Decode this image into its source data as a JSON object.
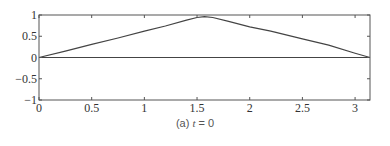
{
  "chart_data": {
    "type": "line",
    "title": "",
    "caption": "(a) t = 0",
    "caption_prefix": "(a)",
    "caption_var": "t",
    "caption_eq": "= 0",
    "xlabel": "",
    "ylabel": "",
    "xlim": [
      0,
      3.1416
    ],
    "ylim": [
      -1,
      1
    ],
    "grid": false,
    "x_ticks": [
      0,
      0.5,
      1,
      1.5,
      2,
      2.5,
      3
    ],
    "x_tick_labels": [
      "0",
      "0.5",
      "1",
      "1.5",
      "2",
      "2.5",
      "3"
    ],
    "y_ticks": [
      -1,
      -0.5,
      0,
      0.5,
      1
    ],
    "y_tick_labels": [
      "−1",
      "−0.5",
      "0",
      "0.5",
      "1"
    ],
    "series": [
      {
        "name": "u(x, t=0)",
        "x": [
          0,
          0.25,
          0.5,
          0.75,
          1.0,
          1.2,
          1.4,
          1.5,
          1.5708,
          1.65,
          1.8,
          2.0,
          2.2,
          2.5,
          2.75,
          3.0,
          3.1416
        ],
        "y": [
          0,
          0.15,
          0.31,
          0.46,
          0.62,
          0.74,
          0.88,
          0.94,
          0.96,
          0.94,
          0.85,
          0.72,
          0.62,
          0.44,
          0.29,
          0.1,
          0
        ]
      },
      {
        "name": "zero line",
        "x": [
          0,
          3.1416
        ],
        "y": [
          0,
          0
        ]
      }
    ]
  }
}
